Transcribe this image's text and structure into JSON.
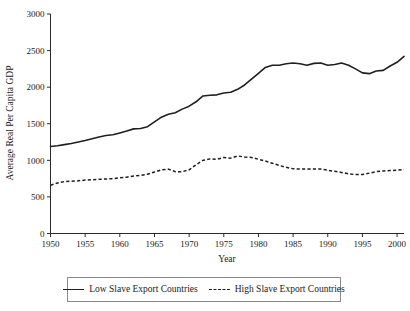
{
  "chart_data": {
    "type": "line",
    "title": "",
    "xlabel": "Year",
    "ylabel": "Average Real Per Capita GDP",
    "xlim": [
      1950,
      2001
    ],
    "ylim": [
      0,
      3000
    ],
    "grid": false,
    "legend_position": "bottom",
    "x_ticks": [
      "1950",
      "1955",
      "1960",
      "1965",
      "1970",
      "1975",
      "1980",
      "1985",
      "1990",
      "1995",
      "2000"
    ],
    "y_ticks": [
      "0",
      "500",
      "1000",
      "1500",
      "2000",
      "2500",
      "3000"
    ],
    "x": [
      1950,
      1951,
      1952,
      1953,
      1954,
      1955,
      1956,
      1957,
      1958,
      1959,
      1960,
      1961,
      1962,
      1963,
      1964,
      1965,
      1966,
      1967,
      1968,
      1969,
      1970,
      1971,
      1972,
      1973,
      1974,
      1975,
      1976,
      1977,
      1978,
      1979,
      1980,
      1981,
      1982,
      1983,
      1984,
      1985,
      1986,
      1987,
      1988,
      1989,
      1990,
      1991,
      1992,
      1993,
      1994,
      1995,
      1996,
      1997,
      1998,
      1999,
      2000,
      2001
    ],
    "series": [
      {
        "name": "Low Slave Export Countries",
        "style": "solid",
        "color": "#1f1f1f",
        "values": [
          1190,
          1200,
          1215,
          1230,
          1250,
          1270,
          1295,
          1320,
          1340,
          1350,
          1375,
          1400,
          1430,
          1435,
          1460,
          1525,
          1590,
          1630,
          1650,
          1700,
          1740,
          1800,
          1880,
          1890,
          1895,
          1920,
          1930,
          1970,
          2030,
          2110,
          2190,
          2270,
          2300,
          2300,
          2320,
          2330,
          2320,
          2300,
          2325,
          2330,
          2300,
          2310,
          2330,
          2300,
          2250,
          2195,
          2185,
          2220,
          2230,
          2290,
          2340,
          2420
        ],
        "end_value": 2510
      },
      {
        "name": "High Slave Export Countries",
        "style": "dashed",
        "color": "#1f1f1f",
        "values": [
          660,
          690,
          710,
          715,
          720,
          730,
          735,
          740,
          745,
          750,
          760,
          770,
          785,
          795,
          810,
          840,
          870,
          880,
          845,
          845,
          870,
          940,
          1000,
          1020,
          1015,
          1040,
          1030,
          1060,
          1045,
          1040,
          1015,
          990,
          960,
          930,
          905,
          885,
          880,
          880,
          880,
          880,
          865,
          850,
          835,
          815,
          805,
          805,
          825,
          845,
          855,
          860,
          865,
          875
        ],
        "end_value": 880
      }
    ]
  },
  "legend": {
    "items": [
      {
        "label": "Low Slave Export Countries",
        "style": "solid"
      },
      {
        "label": "High Slave Export Countries",
        "style": "dashed"
      }
    ]
  },
  "axes": {
    "x_title": "Year",
    "y_title": "Average Real Per Capita GDP"
  }
}
